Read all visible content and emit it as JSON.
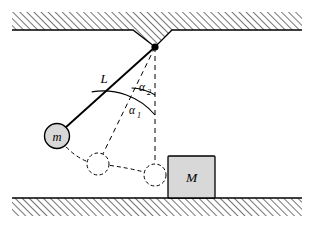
{
  "figure": {
    "type": "physics-diagram",
    "background": "#ffffff",
    "ink": "#000000",
    "fill_gray": "#d8d8d8",
    "hatch_gray": "#808080"
  },
  "labels": {
    "length": "L",
    "angle_outer": "α",
    "angle_outer_sub": "1",
    "angle_inner": "α",
    "angle_inner_sub": "2",
    "mass_small": "m",
    "mass_large": "M"
  },
  "geometry": {
    "pivot": {
      "x": 155,
      "y": 47
    },
    "string_length": 114,
    "bob_radius": 12,
    "bob_center": {
      "x": 57,
      "y": 136
    },
    "mid_circle": {
      "x": 98,
      "y": 164,
      "r": 11
    },
    "contact_circle": {
      "x": 155,
      "y": 175,
      "r": 11
    },
    "block": {
      "x": 168,
      "y": 156,
      "w": 47,
      "h": 44
    },
    "vertical_dash_end": {
      "y": 175
    },
    "alpha1_degrees": 59,
    "alpha2_degrees": 27,
    "ceiling": {
      "y_top": 12,
      "y_bottom": 30,
      "x_left": 12,
      "x_right": 302
    },
    "floor": {
      "y_top": 198,
      "y_bottom": 216,
      "x_left": 12,
      "x_right": 302
    },
    "notch": {
      "left_x": 133,
      "right_x": 172,
      "apex_x": 155,
      "apex_y": 47
    }
  },
  "elements": {
    "ceiling_name": "ceiling-hatched-band",
    "floor_name": "floor-hatched-band",
    "string_name": "pendulum-string",
    "dashed_radius_name": "dashed-radius-line",
    "vertical_name": "dashed-vertical-reference",
    "trajectory_name": "dashed-swing-trajectory"
  }
}
